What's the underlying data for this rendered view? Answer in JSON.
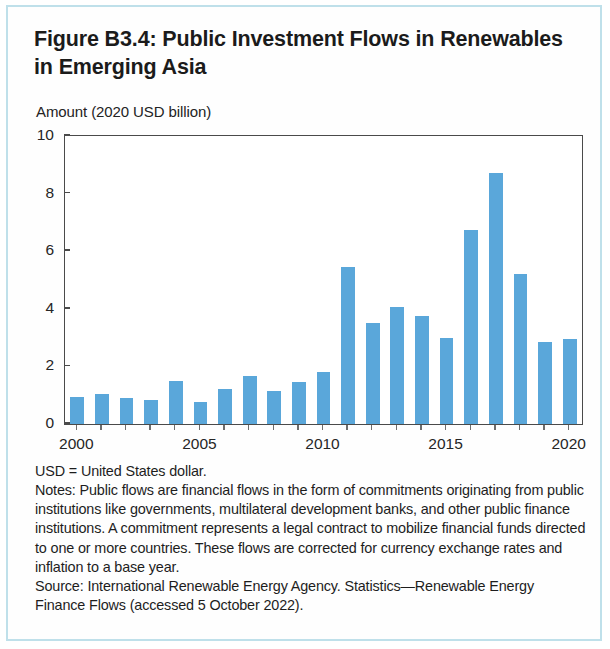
{
  "figure": {
    "title": "Figure B3.4: Public Investment Flows in Renewables in Emerging Asia",
    "border_color": "#bfe0ea"
  },
  "chart_data": {
    "type": "bar",
    "title": "Figure B3.4: Public Investment Flows in Renewables in Emerging Asia",
    "subtitle": "Amount (2020 USD billion)",
    "ylabel": "Amount (2020 USD billion)",
    "xlabel": "",
    "ylim": [
      0,
      10
    ],
    "yticks": [
      0,
      2,
      4,
      6,
      8,
      10
    ],
    "ytick_labels": [
      "0",
      "2",
      "4",
      "6",
      "8",
      "10"
    ],
    "xtick_labels": [
      "2000",
      "2005",
      "2010",
      "2015",
      "2020"
    ],
    "grid": false,
    "legend": null,
    "bar_color": "#5aa7da",
    "categories": [
      "2000",
      "2001",
      "2002",
      "2003",
      "2004",
      "2005",
      "2006",
      "2007",
      "2008",
      "2009",
      "2010",
      "2011",
      "2012",
      "2013",
      "2014",
      "2015",
      "2016",
      "2017",
      "2018",
      "2019",
      "2020"
    ],
    "values": [
      0.95,
      1.05,
      0.9,
      0.85,
      1.5,
      0.75,
      1.2,
      1.65,
      1.15,
      1.45,
      1.8,
      5.45,
      3.5,
      4.05,
      3.75,
      3.0,
      6.75,
      8.7,
      5.2,
      2.85,
      2.95
    ]
  },
  "notes": {
    "abbreviation": "USD = United States dollar.",
    "note_text": "Notes: Public flows are financial flows in the form of commitments originating from public institutions like governments, multilateral development banks, and other public finance institutions. A commitment represents a legal contract to mobilize financial funds directed to one or more countries. These flows are corrected for currency exchange rates and inflation to a base year.",
    "source_text": "Source: International Renewable Energy Agency. Statistics—Renewable Energy Finance Flows (accessed 5 October 2022)."
  }
}
